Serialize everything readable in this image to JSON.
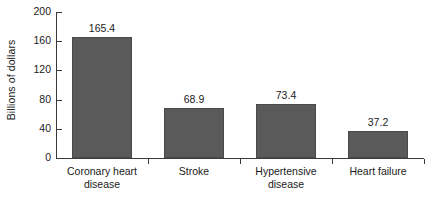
{
  "chart_data": {
    "type": "bar",
    "title": "",
    "subtitle": "",
    "xlabel": "",
    "ylabel": "Billions of dollars",
    "categories": [
      "Coronary heart disease",
      "Stroke",
      "Hypertensive disease",
      "Heart failure"
    ],
    "category_lines": [
      [
        "Coronary heart",
        "disease"
      ],
      [
        "Stroke",
        ""
      ],
      [
        "Hypertensive",
        "disease"
      ],
      [
        "Heart failure",
        ""
      ]
    ],
    "values": [
      165.4,
      68.9,
      73.4,
      37.2
    ],
    "value_labels": [
      "165.4",
      "68.9",
      "73.4",
      "37.2"
    ],
    "ylim": [
      0,
      200
    ],
    "yticks": [
      0,
      40,
      80,
      120,
      160,
      200
    ],
    "ytick_labels": [
      "0",
      "40",
      "80",
      "120",
      "160",
      "200"
    ],
    "grid": false,
    "legend": false,
    "legend_position": "none",
    "bar_color": "#5a5a5a",
    "bar_edge_color": "#4a4a4a",
    "axis_color": "#3a3a3a",
    "background_color": "#ffffff",
    "text_color": "#1a1a1a"
  }
}
